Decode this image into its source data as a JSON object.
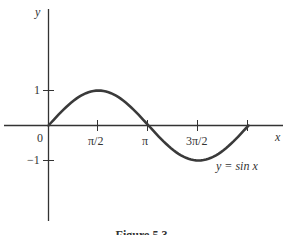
{
  "figure": {
    "caption": "Figure 5.3"
  },
  "chart_data": {
    "type": "line",
    "title": "",
    "xlabel": "x",
    "ylabel": "y",
    "function": "y = sin x",
    "series": [
      {
        "name": "y = sin x",
        "x": [
          0,
          0.785,
          1.571,
          2.356,
          3.142,
          3.927,
          4.712,
          5.498,
          6.283
        ],
        "values": [
          0,
          0.707,
          1,
          0.707,
          0,
          -0.707,
          -1,
          -0.707,
          0
        ]
      }
    ],
    "x_ticks": [
      "0",
      "π/2",
      "π",
      "3π/2"
    ],
    "x_tick_values": [
      0,
      1.571,
      3.142,
      4.712,
      6.283
    ],
    "y_ticks": [
      "1",
      "−1"
    ],
    "y_tick_values": [
      1,
      -1
    ],
    "xlim": [
      0,
      7.3
    ],
    "ylim": [
      -3.3,
      3.3
    ],
    "grid": false,
    "legend": "none",
    "annotations": [
      {
        "text": "y = sin x",
        "x": 5.4,
        "y": -1.1
      }
    ],
    "color": "#3a3a3a"
  },
  "labels": {
    "y_axis": "y",
    "x_axis": "x",
    "origin": "0",
    "tick_pi_2": "π/2",
    "tick_pi": "π",
    "tick_3pi_2": "3π/2",
    "tick_one": "1",
    "tick_neg_one": "−1",
    "curve_label": "y = sin x"
  }
}
